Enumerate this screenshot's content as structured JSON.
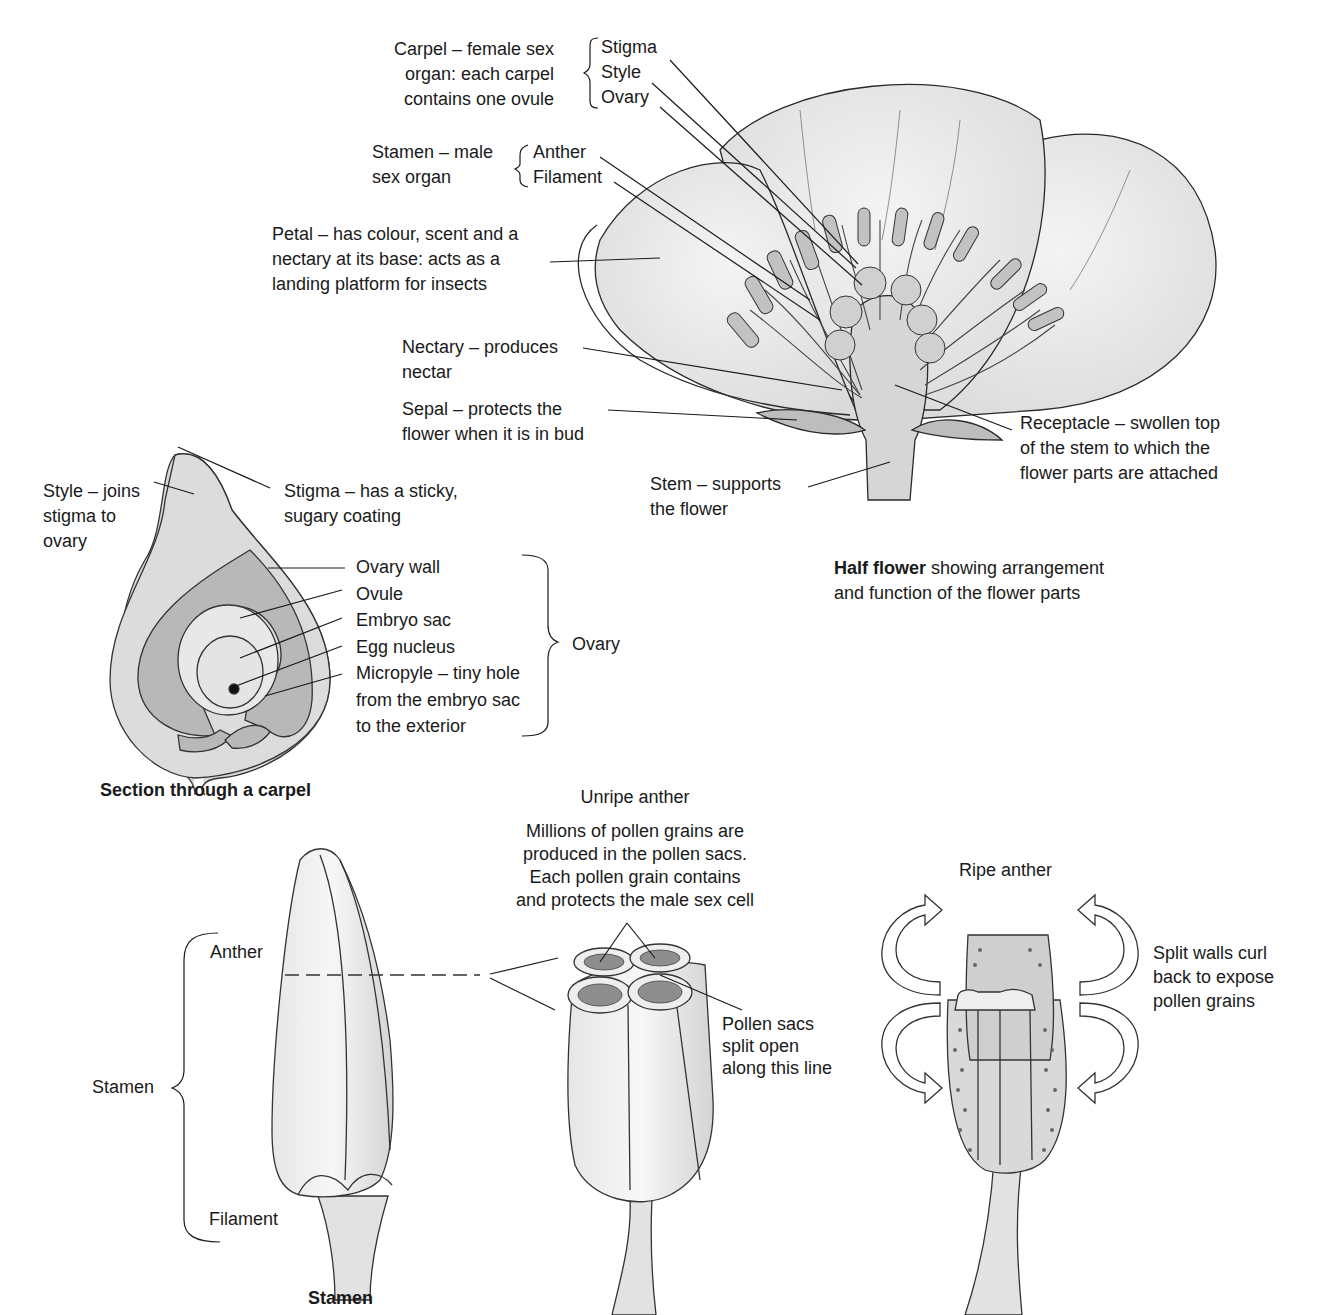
{
  "half_flower": {
    "caption_bold": "Half flower",
    "caption_rest": " showing arrangement",
    "caption_line2": "and function of the flower parts",
    "carpel_group": {
      "description": [
        "Carpel – female sex",
        "organ: each carpel",
        "contains one ovule"
      ],
      "parts": [
        "Stigma",
        "Style",
        "Ovary"
      ]
    },
    "stamen_group": {
      "description": [
        "Stamen – male",
        "sex organ"
      ],
      "parts": [
        "Anther",
        "Filament"
      ]
    },
    "petal": [
      "Petal – has colour, scent and a",
      "nectary at its base: acts as a",
      "landing platform for insects"
    ],
    "nectary": [
      "Nectary – produces",
      "nectar"
    ],
    "sepal": [
      "Sepal – protects the",
      "flower when it is in bud"
    ],
    "receptacle": [
      "Receptacle – swollen top",
      "of the stem to which the",
      "flower parts are attached"
    ],
    "stem": [
      "Stem – supports",
      "the flower"
    ]
  },
  "carpel_section": {
    "caption": "Section through a carpel",
    "style": [
      "Style – joins",
      "stigma to",
      "ovary"
    ],
    "stigma": [
      "Stigma – has a sticky,",
      "sugary coating"
    ],
    "ovary_parts": [
      "Ovary wall",
      "Ovule",
      "Embryo sac",
      "Egg nucleus",
      "Micropyle – tiny hole",
      "from the embryo sac",
      "to the exterior"
    ],
    "ovary_bracket_label": "Ovary"
  },
  "stamen_view": {
    "caption": "Stamen",
    "bracket_label": "Stamen",
    "anther": "Anther",
    "filament": "Filament"
  },
  "unripe_anther": {
    "title": "Unripe anther",
    "description": [
      "Millions of pollen grains are",
      "produced in the pollen sacs.",
      "Each pollen grain contains",
      "and protects the male sex cell"
    ],
    "pollen_sacs": [
      "Pollen sacs",
      "split open",
      "along this line"
    ]
  },
  "ripe_anther": {
    "title": "Ripe anther",
    "description": [
      "Split walls curl",
      "back to expose",
      "pollen grains"
    ]
  },
  "colors": {
    "ink": "#1a1a1a",
    "petal_fill": "#ececec",
    "dark_fill": "#c9c9c9",
    "mid_fill": "#dcdcdc"
  }
}
